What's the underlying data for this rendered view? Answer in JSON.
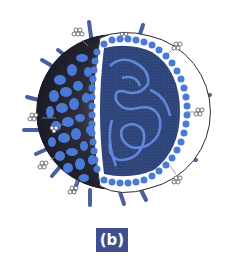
{
  "figure": {
    "label": "(b)",
    "parts": [
      "surface-spikes",
      "flower-glycoproteins",
      "outer-envelope",
      "lipid-membrane-band",
      "capsid-core",
      "genome-strand"
    ],
    "colors": {
      "spike": "#4a5f9e",
      "outer_blob": "#4a7ad8",
      "outer_shadow": "#2a2a3a",
      "membrane_band": "#ffffff",
      "membrane_bead": "#4a7ad8",
      "core": "#2f4478",
      "genome": "#5f88d8",
      "label_bg": "#3d4f8e",
      "label_text": "#ffffff"
    }
  }
}
